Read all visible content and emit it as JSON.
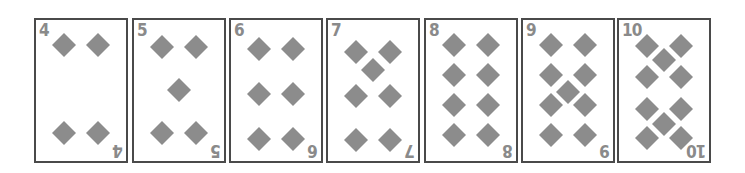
{
  "suit": "diamonds",
  "suit_color": "#8c8c8c",
  "cards": [
    {
      "rank": "4",
      "suit_icon": "diamond-icon"
    },
    {
      "rank": "5",
      "suit_icon": "diamond-icon"
    },
    {
      "rank": "6",
      "suit_icon": "diamond-icon"
    },
    {
      "rank": "7",
      "suit_icon": "diamond-icon"
    },
    {
      "rank": "8",
      "suit_icon": "diamond-icon"
    },
    {
      "rank": "9",
      "suit_icon": "diamond-icon"
    },
    {
      "rank": "10",
      "suit_icon": "diamond-icon"
    }
  ]
}
